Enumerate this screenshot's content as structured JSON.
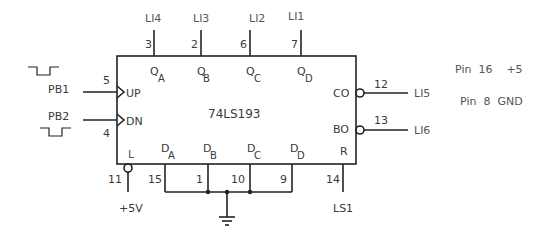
{
  "chip": {
    "part_number": "74LS193",
    "outputs": [
      {
        "name": "Q",
        "sub": "A",
        "pin": "3",
        "net": "LI4",
        "x": 150
      },
      {
        "name": "Q",
        "sub": "B",
        "pin": "2",
        "net": "LI3",
        "x": 200
      },
      {
        "name": "Q",
        "sub": "C",
        "pin": "6",
        "net": "LI2",
        "x": 250
      },
      {
        "name": "Q",
        "sub": "D",
        "pin": "7",
        "net": "LI1",
        "x": 300
      }
    ],
    "inputs_left": [
      {
        "label": "UP",
        "pin": "5",
        "net": "PB1"
      },
      {
        "label": "DN",
        "pin": "4",
        "net": "PB2"
      }
    ],
    "outputs_right": [
      {
        "label": "CO",
        "pin": "12",
        "net": "LI5"
      },
      {
        "label": "BO",
        "pin": "13",
        "net": "LI6"
      }
    ],
    "load": {
      "label": "L",
      "pin": "11",
      "net": "+5V"
    },
    "data_inputs": [
      {
        "name": "D",
        "sub": "A",
        "pin": "15"
      },
      {
        "name": "D",
        "sub": "B",
        "pin": "1"
      },
      {
        "name": "D",
        "sub": "C",
        "pin": "10"
      },
      {
        "name": "D",
        "sub": "D",
        "pin": "9"
      }
    ],
    "reset": {
      "label": "R",
      "pin": "14",
      "net": "LS1"
    }
  },
  "notes": {
    "power": "Pin  16    +5",
    "ground": "Pin  8  GND"
  },
  "colors": {
    "wire": "#222222",
    "text": "#3a3a3a",
    "background": "#ffffff"
  }
}
